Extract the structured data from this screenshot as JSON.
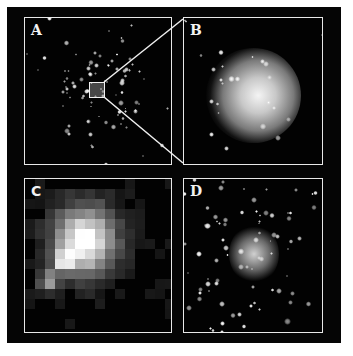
{
  "figure": {
    "panels": [
      {
        "id": "A",
        "label": "A",
        "description": "wide-field star cluster with inset box"
      },
      {
        "id": "B",
        "label": "B",
        "description": "zoomed bright cluster core, diffuse glow"
      },
      {
        "id": "C",
        "label": "C",
        "description": "pixelated low-resolution view of cluster"
      },
      {
        "id": "D",
        "label": "D",
        "description": "resolved star field with bright central region"
      }
    ],
    "colors": {
      "background": "#050505",
      "frame": "#e8e8e8",
      "page": "#ffffff"
    }
  }
}
